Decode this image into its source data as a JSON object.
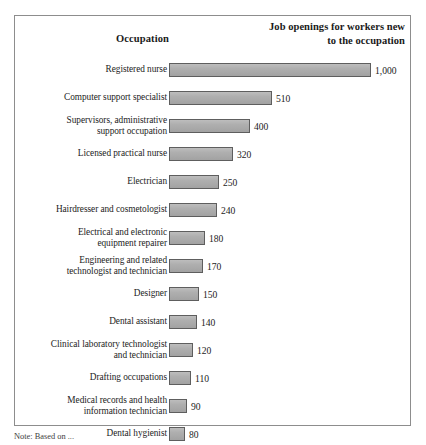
{
  "header": {
    "occupation_label": "Occupation",
    "openings_line1": "Job openings for workers new",
    "openings_line2": "to the occupation"
  },
  "note": {
    "text": "Note: Based on ..."
  },
  "colors": {
    "bar_fill": "#ababab",
    "bar_stroke": "#5e5e5e",
    "frame_border": "#8d8d8d",
    "background": "#ffffff",
    "text": "#1c1c1c"
  },
  "chart_data": {
    "type": "bar",
    "orientation": "horizontal",
    "title": "Job openings for workers new to the occupation",
    "xlabel": "Job openings for workers new to the occupation",
    "ylabel": "Occupation",
    "xlim": [
      0,
      1000
    ],
    "grid": false,
    "legend": false,
    "categories": [
      "Registered nurse",
      "Computer support specialist",
      "Supervisors, administrative support occupation",
      "Licensed practical nurse",
      "Electrician",
      "Hairdresser and cosmetologist",
      "Electrical and electronic equipment repairer",
      "Engineering and related technologist and technician",
      "Designer",
      "Dental assistant",
      "Clinical laboratory technologist and technician",
      "Drafting occupations",
      "Medical records and health information technician",
      "Dental hygienist"
    ],
    "values": [
      1000,
      510,
      400,
      320,
      250,
      240,
      180,
      170,
      150,
      140,
      120,
      110,
      90,
      80
    ],
    "value_labels": [
      "1,000",
      "510",
      "400",
      "320",
      "250",
      "240",
      "180",
      "170",
      "150",
      "140",
      "120",
      "110",
      "90",
      "80"
    ]
  },
  "rows": [
    {
      "label_lines": [
        "Registered nurse"
      ],
      "value": 1000,
      "value_label": "1,000"
    },
    {
      "label_lines": [
        "Computer support specialist"
      ],
      "value": 510,
      "value_label": "510"
    },
    {
      "label_lines": [
        "Supervisors, administrative",
        "support occupation"
      ],
      "value": 400,
      "value_label": "400"
    },
    {
      "label_lines": [
        "Licensed practical nurse"
      ],
      "value": 320,
      "value_label": "320"
    },
    {
      "label_lines": [
        "Electrician"
      ],
      "value": 250,
      "value_label": "250"
    },
    {
      "label_lines": [
        "Hairdresser and cosmetologist"
      ],
      "value": 240,
      "value_label": "240"
    },
    {
      "label_lines": [
        "Electrical and electronic",
        "equipment repairer"
      ],
      "value": 180,
      "value_label": "180"
    },
    {
      "label_lines": [
        "Engineering and related",
        "technologist and technician"
      ],
      "value": 170,
      "value_label": "170"
    },
    {
      "label_lines": [
        "Designer"
      ],
      "value": 150,
      "value_label": "150"
    },
    {
      "label_lines": [
        "Dental assistant"
      ],
      "value": 140,
      "value_label": "140"
    },
    {
      "label_lines": [
        "Clinical laboratory technologist",
        "and technician"
      ],
      "value": 120,
      "value_label": "120"
    },
    {
      "label_lines": [
        "Drafting occupations"
      ],
      "value": 110,
      "value_label": "110"
    },
    {
      "label_lines": [
        "Medical records and health",
        "information technician"
      ],
      "value": 90,
      "value_label": "90"
    },
    {
      "label_lines": [
        "Dental hygienist"
      ],
      "value": 80,
      "value_label": "80"
    }
  ],
  "scale": {
    "px_per_unit": 0.2015,
    "min_bar_px": 16
  }
}
